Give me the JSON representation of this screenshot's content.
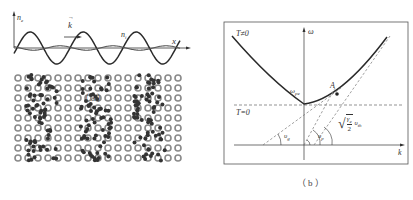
{
  "figure": {
    "panel_a": {
      "caption": "（a）",
      "axis_y_label": "n",
      "axis_y_sub": "e",
      "axis_x_label": "x",
      "wave_vector_label": "k",
      "ion_density_label": "n",
      "ion_density_sub": "i",
      "lattice": {
        "rows": 9,
        "ion_symbol": "hollow-ring",
        "electron_symbol": "filled-dot",
        "electron_clusters": 3
      }
    },
    "panel_b": {
      "caption": "（b）",
      "axis_y_label": "ω",
      "axis_x_label": "k",
      "label_T_nonzero": "T≠0",
      "label_T_zero": "T=0",
      "omega_pe_label": "ω",
      "omega_pe_sub": "pe",
      "point_label": "A",
      "angle_label_1": "υ",
      "angle_label_1_sub": "g",
      "angle_label_2": "υ",
      "angle_label_2_sub": "p",
      "asymptote_label": "√(γe/2) υth",
      "asymptote_gamma": "γ",
      "asymptote_gamma_sub": "e",
      "asymptote_denominator": "2",
      "asymptote_v": "υ",
      "asymptote_v_sub": "th"
    }
  },
  "colors": {
    "line": "#2a2a2a",
    "dashed": "#777777",
    "ring": "#8a8a8a",
    "dot": "#333333",
    "frame": "#555555"
  }
}
